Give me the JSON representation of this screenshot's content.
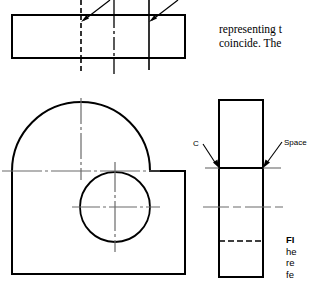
{
  "page": {
    "width": 312,
    "height": 285,
    "background": "#ffffff",
    "ink": "#000000"
  },
  "body_text": {
    "line_1": "representing t",
    "line_2": "coincide. The"
  },
  "caption": {
    "fig_label": "FI",
    "line_2": "he",
    "line_3": "re",
    "line_4": "fe"
  },
  "annotations": [
    {
      "name": "c-label",
      "text": "C",
      "leader_from": [
        203,
        146
      ],
      "leader_to": [
        219,
        168
      ]
    },
    {
      "name": "space-label",
      "text": "Space",
      "leader_from": [
        283,
        143
      ],
      "leader_to": [
        263,
        168
      ]
    }
  ],
  "views": {
    "top_view": {
      "name": "top-view",
      "rect": {
        "x": 12,
        "y": 15,
        "width": 173,
        "height": 43
      },
      "hidden_line_x": 81,
      "center_line_x": 114,
      "visible_line_x": 149,
      "extension_top": 0,
      "extension_bottom": 72,
      "leaders": [
        {
          "from": [
            109,
            2
          ],
          "to": [
            82,
            22
          ]
        },
        {
          "from": [
            176,
            2
          ],
          "to": [
            150,
            22
          ]
        }
      ]
    },
    "front_view": {
      "name": "front-view",
      "rect": {
        "x": 12,
        "y": 171,
        "width": 173,
        "height": 103
      },
      "arc": {
        "cx": 81,
        "cy": 171,
        "r": 69
      },
      "hole": {
        "cx": 115,
        "cy": 207,
        "r": 35
      },
      "center_lines": {
        "arc_vertical_x": 81,
        "arc_horizontal_y": 171,
        "hole_vertical_x": 115,
        "hole_horizontal_y": 207
      }
    },
    "side_view": {
      "name": "side-view",
      "rect": {
        "x": 219,
        "y": 100,
        "width": 44,
        "height": 177
      },
      "visible_line_y": 168,
      "center_line_y": 207,
      "hidden_line_y": 241,
      "extension_left": 203,
      "extension_right": 283
    }
  },
  "line_styles": {
    "object_line_width": 2,
    "thin_line_width": 1,
    "hidden_dash": "5,3",
    "center_dash": "12,3,3,3"
  }
}
